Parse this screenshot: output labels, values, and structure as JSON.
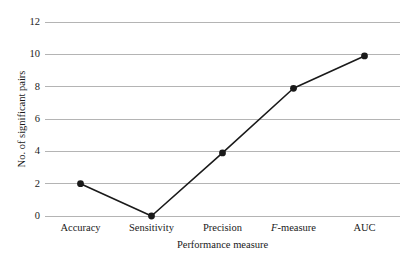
{
  "chart_data": {
    "type": "line",
    "title": "",
    "subtitle": "",
    "xlabel": "Performance measure",
    "ylabel": "No. of significant pairs",
    "categories": [
      "Accuracy",
      "Sensitivity",
      "Precision",
      "F-measure",
      "AUC"
    ],
    "values": [
      2,
      0,
      3.9,
      7.9,
      9.9
    ],
    "series": [
      {
        "name": "No. of significant pairs",
        "values": [
          2,
          0,
          3.9,
          7.9,
          9.9
        ]
      }
    ],
    "ylim": [
      0,
      12
    ],
    "yticks": [
      0,
      2,
      4,
      6,
      8,
      10,
      12
    ],
    "ytick_labels": [
      "0",
      "2",
      "4",
      "6",
      "8",
      "10",
      "12"
    ],
    "grid": "horizontal",
    "legend": "none",
    "marker": "filled-circle",
    "colors": {
      "line": "#1a1a1a",
      "marker": "#1a1a1a",
      "grid": "#b4b4b4",
      "background": "#ffffff",
      "text": "#1a1a1a"
    }
  },
  "axis": {
    "x_tick_labels": [
      {
        "text": "Accuracy",
        "italic_prefix": ""
      },
      {
        "text": "Sensitivity",
        "italic_prefix": ""
      },
      {
        "text": "Precision",
        "italic_prefix": ""
      },
      {
        "text": "-measure",
        "italic_prefix": "F"
      },
      {
        "text": "AUC",
        "italic_prefix": ""
      }
    ]
  }
}
